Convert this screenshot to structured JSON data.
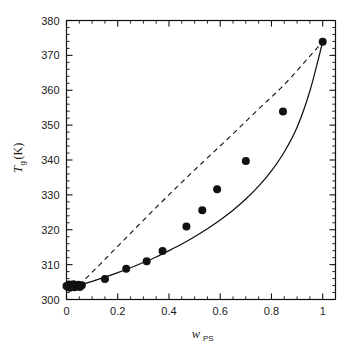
{
  "chart_data": {
    "type": "scatter",
    "title": "",
    "xlabel": "w_PS",
    "xlabel_main": "w",
    "xlabel_sub": "PS",
    "ylabel": "T_g (K)",
    "ylabel_main": "T",
    "ylabel_sub": "g",
    "ylabel_unit": "(K)",
    "xlim": [
      0,
      1.05
    ],
    "ylim": [
      300,
      380
    ],
    "xticks": [
      0,
      0.2,
      0.4,
      0.6,
      0.8,
      1
    ],
    "xticklabels": [
      "0",
      "0.2",
      "0.4",
      "0.6",
      "0.8",
      "1"
    ],
    "xminor_step": 0.05,
    "yticks": [
      300,
      310,
      320,
      330,
      340,
      350,
      360,
      370,
      380
    ],
    "yticklabels": [
      "300",
      "310",
      "320",
      "330",
      "340",
      "350",
      "360",
      "370",
      "380"
    ],
    "yminor_step": 2,
    "grid": false,
    "legend": "none",
    "tick_direction": "in",
    "frame": "box",
    "marker_color": "#111111",
    "marker_shape": "filled-circle",
    "marker_size_px": 8,
    "points": [
      {
        "x": 0.0,
        "y": 303.9
      },
      {
        "x": 0.005,
        "y": 303.6
      },
      {
        "x": 0.01,
        "y": 304.3
      },
      {
        "x": 0.013,
        "y": 303.4
      },
      {
        "x": 0.018,
        "y": 304.1
      },
      {
        "x": 0.022,
        "y": 303.7
      },
      {
        "x": 0.027,
        "y": 304.4
      },
      {
        "x": 0.031,
        "y": 303.5
      },
      {
        "x": 0.035,
        "y": 304.0
      },
      {
        "x": 0.04,
        "y": 303.8
      },
      {
        "x": 0.046,
        "y": 304.2
      },
      {
        "x": 0.052,
        "y": 303.6
      },
      {
        "x": 0.06,
        "y": 304.1
      },
      {
        "x": 0.15,
        "y": 305.9
      },
      {
        "x": 0.233,
        "y": 308.8
      },
      {
        "x": 0.313,
        "y": 311.0
      },
      {
        "x": 0.375,
        "y": 313.9
      },
      {
        "x": 0.468,
        "y": 320.9
      },
      {
        "x": 0.53,
        "y": 325.6
      },
      {
        "x": 0.588,
        "y": 331.6
      },
      {
        "x": 0.7,
        "y": 339.7
      },
      {
        "x": 0.845,
        "y": 353.9
      },
      {
        "x": 1.0,
        "y": 373.9
      }
    ],
    "series": [
      {
        "name": "solid-model-curve",
        "style": "solid",
        "color": "#111111",
        "x": [
          0.05,
          0.1,
          0.15,
          0.2,
          0.25,
          0.3,
          0.35,
          0.4,
          0.45,
          0.5,
          0.55,
          0.6,
          0.65,
          0.7,
          0.75,
          0.8,
          0.85,
          0.9,
          0.95,
          1.0
        ],
        "y": [
          304.1,
          305.2,
          306.4,
          307.7,
          309.1,
          310.6,
          312.2,
          314.0,
          315.9,
          318.0,
          320.3,
          322.8,
          325.6,
          328.8,
          332.5,
          336.9,
          342.3,
          349.4,
          359.8,
          373.9
        ]
      },
      {
        "name": "dashed-reference-line",
        "style": "dashed",
        "color": "#111111",
        "x": [
          0.05,
          0.15,
          0.25,
          0.35,
          0.45,
          0.55,
          0.65,
          0.75,
          0.85,
          0.95,
          1.0
        ],
        "y": [
          304.1,
          311.5,
          319.0,
          326.4,
          333.6,
          340.6,
          347.5,
          354.6,
          361.6,
          369.8,
          373.9
        ]
      }
    ]
  },
  "axes": {
    "x_label_main": "w",
    "x_label_sub": "PS",
    "y_label_main": "T",
    "y_label_sub": "g",
    "y_label_unit": " (K)"
  }
}
